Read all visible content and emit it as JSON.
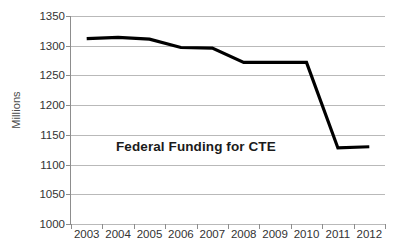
{
  "chart_data": {
    "type": "line",
    "title": "Federal Funding for CTE",
    "xlabel": "",
    "ylabel": "Millions",
    "categories": [
      "2003",
      "2004",
      "2005",
      "2006",
      "2007",
      "2008",
      "2009",
      "2010",
      "2011",
      "2012"
    ],
    "values": [
      1312,
      1314,
      1311,
      1297,
      1296,
      1272,
      1272,
      1272,
      1128,
      1130
    ],
    "series": [
      {
        "name": "Federal Funding for CTE",
        "values": [
          1312,
          1314,
          1311,
          1297,
          1296,
          1272,
          1272,
          1272,
          1128,
          1130
        ],
        "color": "#000000"
      }
    ],
    "ylim": [
      1000,
      1350
    ],
    "ytick_labels": [
      "1350",
      "1300",
      "1250",
      "1200",
      "1150",
      "1100",
      "1050",
      "1000"
    ],
    "ytick_values": [
      1350,
      1300,
      1250,
      1200,
      1150,
      1100,
      1050,
      1000
    ],
    "grid": true,
    "grid_color": "#b9b9b9",
    "axis_color": "#8d8d8d",
    "legend": "none",
    "background": "#ffffff"
  },
  "axes": {
    "y_title": "Millions"
  }
}
